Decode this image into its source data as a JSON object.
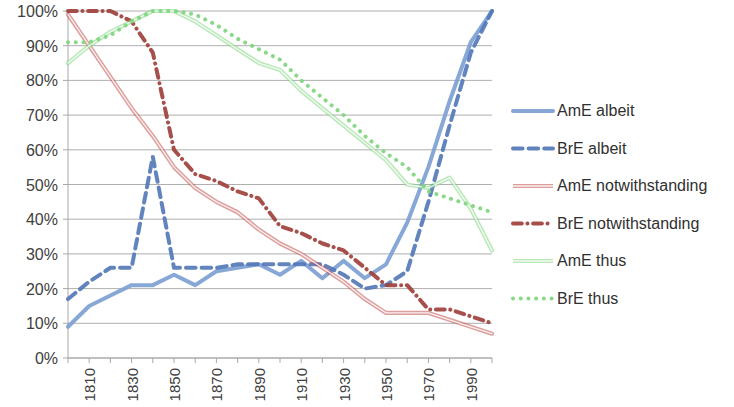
{
  "chart_data": {
    "type": "line",
    "title": "",
    "subtitle": "",
    "xlabel": "",
    "ylabel": "",
    "xlim": [
      1800,
      2000
    ],
    "ylim": [
      0,
      1
    ],
    "grid": true,
    "legend_position": "right",
    "y_ticks": [
      "0%",
      "10%",
      "20%",
      "30%",
      "40%",
      "50%",
      "60%",
      "70%",
      "80%",
      "90%",
      "100%"
    ],
    "y_tick_values": [
      0,
      10,
      20,
      30,
      40,
      50,
      60,
      70,
      80,
      90,
      100
    ],
    "x_ticks": [
      "1810",
      "1830",
      "1850",
      "1870",
      "1890",
      "1910",
      "1930",
      "1950",
      "1970",
      "1990"
    ],
    "x_tick_values": [
      1810,
      1830,
      1850,
      1870,
      1890,
      1910,
      1930,
      1950,
      1970,
      1990
    ],
    "x_minor_step": 10,
    "x": [
      1800,
      1810,
      1820,
      1830,
      1840,
      1850,
      1860,
      1870,
      1880,
      1890,
      1900,
      1910,
      1920,
      1930,
      1940,
      1950,
      1960,
      1970,
      1980,
      1990,
      2000
    ],
    "series": [
      {
        "name": "AmE albeit",
        "color": "#7d9fd3",
        "style": "solid",
        "width": 4,
        "values": [
          9,
          15,
          18,
          21,
          21,
          24,
          21,
          25,
          26,
          27,
          24,
          28,
          23,
          28,
          23,
          27,
          39,
          55,
          74,
          91,
          100
        ]
      },
      {
        "name": "BrE albeit",
        "color": "#5478b8",
        "style": "dashed",
        "width": 4,
        "values": [
          17,
          22,
          26,
          26,
          58,
          26,
          26,
          26,
          27,
          27,
          27,
          27,
          27,
          24,
          20,
          21,
          25,
          45,
          67,
          88,
          100
        ]
      },
      {
        "name": "AmE notwithstanding",
        "color": "#c0504d",
        "style": "solid-double",
        "width": 2,
        "values": [
          99,
          90,
          81,
          72,
          64,
          55,
          49,
          45,
          42,
          37,
          33,
          30,
          26,
          22,
          17,
          13,
          13,
          13,
          11,
          9,
          7
        ]
      },
      {
        "name": "BrE notwithstanding",
        "color": "#a0403c",
        "style": "dashdot",
        "width": 4,
        "values": [
          100,
          100,
          100,
          97,
          88,
          60,
          53,
          51,
          48,
          46,
          38,
          36,
          33,
          31,
          26,
          21,
          21,
          14,
          14,
          12,
          10
        ]
      },
      {
        "name": "AmE thus",
        "color": "#7fd67f",
        "style": "solid-double",
        "width": 2,
        "values": [
          85,
          90,
          94,
          97,
          100,
          100,
          97,
          93,
          89,
          85,
          83,
          77,
          72,
          67,
          62,
          57,
          50,
          49,
          52,
          43,
          31
        ]
      },
      {
        "name": "BrE thus",
        "color": "#7fd67f",
        "style": "dotted",
        "width": 4,
        "values": [
          91,
          91,
          93,
          97,
          100,
          100,
          99,
          96,
          92,
          89,
          86,
          80,
          75,
          70,
          64,
          59,
          55,
          48,
          46,
          44,
          42
        ]
      }
    ]
  },
  "legend": {
    "items": [
      {
        "label": "AmE albeit"
      },
      {
        "label": "BrE albeit"
      },
      {
        "label": "AmE notwithstanding"
      },
      {
        "label": "BrE notwithstanding"
      },
      {
        "label": "AmE thus"
      },
      {
        "label": "BrE thus"
      }
    ]
  }
}
